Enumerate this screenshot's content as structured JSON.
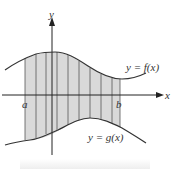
{
  "diagram": {
    "axis_x_label": "x",
    "axis_y_label": "y",
    "label_a": "a",
    "label_b": "b",
    "curve_f_label": "y = f(x)",
    "curve_g_label": "y = g(x)",
    "colors": {
      "fill": "#d9d9d9",
      "line": "#333333",
      "axis": "#222222"
    },
    "strips_x_px": [
      25,
      36,
      46,
      57,
      68,
      79,
      90,
      101,
      112,
      120
    ]
  }
}
